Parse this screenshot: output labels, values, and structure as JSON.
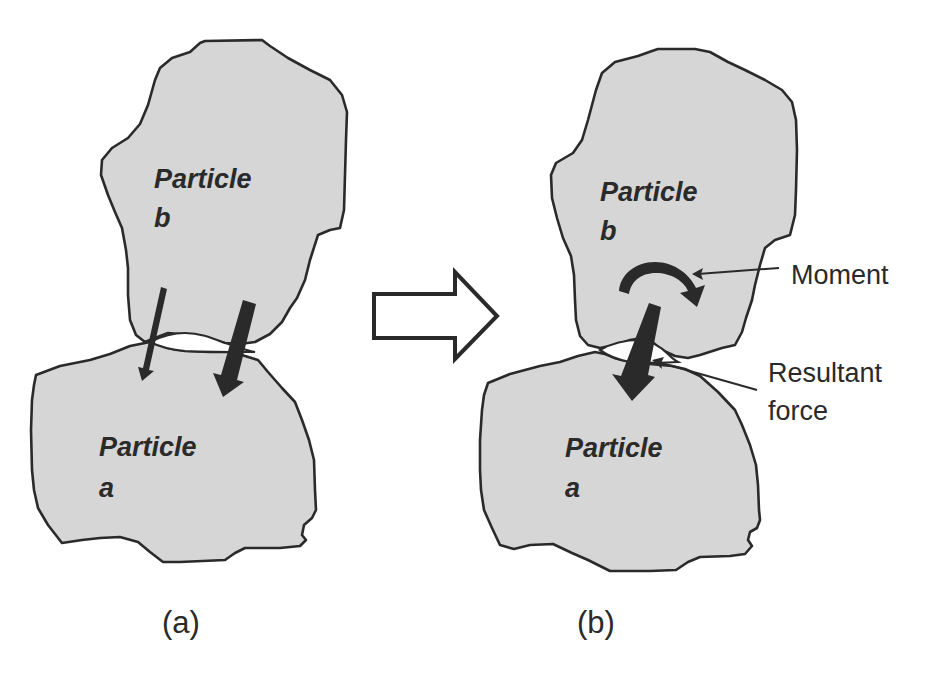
{
  "figure": {
    "panels": [
      {
        "id": "a",
        "caption": "(a)",
        "particle_top": {
          "name_line1": "Particle",
          "name_line2": "b"
        },
        "particle_bottom": {
          "name_line1": "Particle",
          "name_line2": "a"
        },
        "forces": [
          {
            "type": "contact-force",
            "size": "thin"
          },
          {
            "type": "contact-force",
            "size": "thick"
          }
        ]
      },
      {
        "id": "b",
        "caption": "(b)",
        "particle_top": {
          "name_line1": "Particle",
          "name_line2": "b"
        },
        "particle_bottom": {
          "name_line1": "Particle",
          "name_line2": "a"
        },
        "annotations": {
          "moment": "Moment",
          "resultant_line1": "Resultant",
          "resultant_line2": "force"
        }
      }
    ],
    "transition_arrow": "right-hollow-arrow",
    "colors": {
      "particle_fill": "#d6d6d6",
      "outline": "#2a2a2a",
      "background": "#ffffff"
    }
  }
}
